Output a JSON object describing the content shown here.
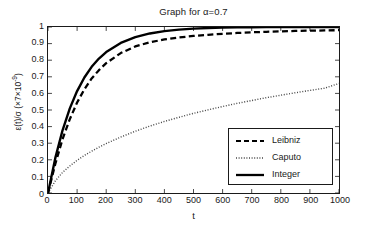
{
  "chart_data": {
    "type": "line",
    "title": "Graph for α=0.7",
    "xlabel": "t",
    "ylabel_html": "ε(t)/σ (×7×10<sup>-9</sup>)",
    "xlim": [
      0,
      1000
    ],
    "ylim": [
      0,
      1
    ],
    "grid": false,
    "legend_position": "lower right",
    "xticks": [
      "0",
      "100",
      "200",
      "300",
      "400",
      "500",
      "600",
      "700",
      "800",
      "900",
      "1000"
    ],
    "xtick_values": [
      0,
      100,
      200,
      300,
      400,
      500,
      600,
      700,
      800,
      900,
      1000
    ],
    "yticks": [
      "0",
      "0.1",
      "0.2",
      "0.3",
      "0.4",
      "0.5",
      "0.6",
      "0.7",
      "0.8",
      "0.9",
      "1"
    ],
    "ytick_values": [
      0,
      0.1,
      0.2,
      0.3,
      0.4,
      0.5,
      0.6,
      0.7,
      0.8,
      0.9,
      1
    ],
    "x": [
      0,
      25,
      50,
      75,
      100,
      125,
      150,
      175,
      200,
      250,
      300,
      350,
      400,
      450,
      500,
      550,
      600,
      650,
      700,
      750,
      800,
      850,
      900,
      950,
      1000
    ],
    "series": [
      {
        "name": "Leibniz",
        "style": "dashed",
        "color": "#000000",
        "values": [
          0,
          0.175,
          0.325,
          0.445,
          0.545,
          0.625,
          0.69,
          0.74,
          0.782,
          0.843,
          0.883,
          0.908,
          0.925,
          0.937,
          0.946,
          0.953,
          0.959,
          0.964,
          0.968,
          0.971,
          0.974,
          0.976,
          0.978,
          0.979,
          0.981
        ]
      },
      {
        "name": "Caputo",
        "style": "dotted",
        "color": "#444444",
        "values": [
          0,
          0.073,
          0.124,
          0.163,
          0.197,
          0.226,
          0.252,
          0.276,
          0.298,
          0.337,
          0.372,
          0.403,
          0.431,
          0.456,
          0.48,
          0.501,
          0.521,
          0.54,
          0.557,
          0.574,
          0.589,
          0.604,
          0.618,
          0.631,
          0.66
        ]
      },
      {
        "name": "Integer",
        "style": "solid",
        "color": "#000000",
        "values": [
          0,
          0.21,
          0.378,
          0.51,
          0.614,
          0.696,
          0.76,
          0.81,
          0.849,
          0.904,
          0.939,
          0.961,
          0.975,
          0.984,
          0.99,
          0.994,
          0.996,
          0.998,
          0.998,
          0.999,
          0.999,
          1.0,
          1.0,
          1.0,
          1.0
        ]
      }
    ]
  },
  "legend": {
    "items": [
      {
        "label": "Leibniz"
      },
      {
        "label": "Caputo"
      },
      {
        "label": "Integer"
      }
    ]
  }
}
